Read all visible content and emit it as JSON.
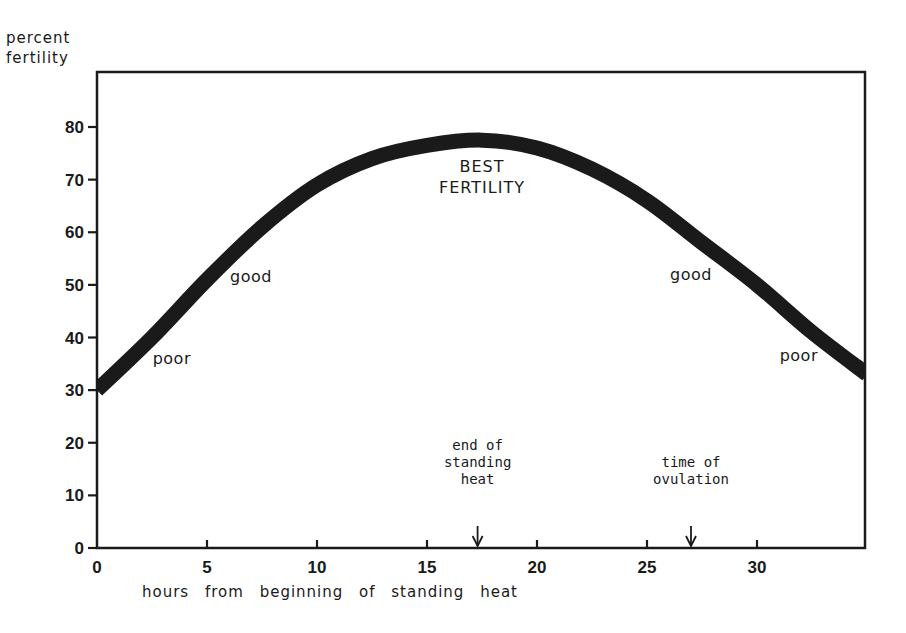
{
  "chart_data": {
    "type": "line",
    "title": "",
    "xlabel": "hours from beginning of standing heat",
    "ylabel_lines": [
      "percent",
      "fertility"
    ],
    "xlim": [
      0,
      35
    ],
    "ylim": [
      0,
      90
    ],
    "xticks": [
      0,
      5,
      10,
      15,
      20,
      25,
      30
    ],
    "yticks": [
      0,
      10,
      20,
      30,
      40,
      50,
      60,
      70,
      80
    ],
    "grid": false,
    "series": [
      {
        "name": "fertility",
        "color": "#1a1a1a",
        "x": [
          0,
          2.5,
          5,
          7.5,
          10,
          12.5,
          15,
          17.5,
          20,
          22.5,
          25,
          27.5,
          30,
          32.5,
          35
        ],
        "y": [
          30,
          40,
          51,
          61,
          69,
          74,
          76.5,
          77.5,
          76,
          72,
          66,
          58,
          50,
          41,
          33
        ]
      }
    ],
    "zone_labels": [
      {
        "text": "poor",
        "x": 3.4,
        "y": 35
      },
      {
        "text": "good",
        "x": 7,
        "y": 50.5
      },
      {
        "text": "BEST",
        "x": 17.5,
        "y": 71.5
      },
      {
        "text": "FERTILITY",
        "x": 17.5,
        "y": 67.5
      },
      {
        "text": "good",
        "x": 27,
        "y": 51
      },
      {
        "text": "poor",
        "x": 31.9,
        "y": 35.5
      }
    ],
    "annotations": [
      {
        "lines": [
          "end of",
          "standing",
          "heat"
        ],
        "x": 17.3
      },
      {
        "lines": [
          "time of",
          "ovulation"
        ],
        "x": 27
      }
    ]
  }
}
